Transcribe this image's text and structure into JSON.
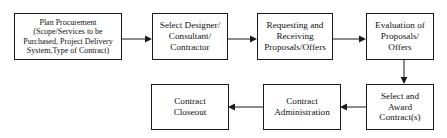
{
  "diagram": {
    "colors": {
      "stroke": "#1a1a1a",
      "text": "#111111",
      "background": "#ffffff"
    },
    "nodes": [
      {
        "id": "plan-procurement",
        "label": "Plan Procurement\n(Scope/Services to be\nPurchased, Project Delivery\nSystem,Type of Contract)"
      },
      {
        "id": "select-designer",
        "label": "Select Designer/\nConsultant/\nContractor"
      },
      {
        "id": "requesting-receiving",
        "label": "Requesting and\nReceiving\nProposals/Offers"
      },
      {
        "id": "evaluation-proposals",
        "label": "Evaluation of\nProposals/\nOffers"
      },
      {
        "id": "select-award",
        "label": "Select and\nAward\nContract(s)"
      },
      {
        "id": "contract-administration",
        "label": "Contract\nAdministration"
      },
      {
        "id": "contract-closeout",
        "label": "Contract\nCloseout"
      }
    ],
    "connectors": [
      {
        "id": "plan-to-select-designer",
        "direction": "right"
      },
      {
        "id": "select-designer-to-requesting",
        "direction": "right"
      },
      {
        "id": "requesting-to-evaluation",
        "direction": "right"
      },
      {
        "id": "evaluation-to-select-award",
        "direction": "down"
      },
      {
        "id": "select-award-to-administration",
        "direction": "left"
      },
      {
        "id": "administration-to-closeout",
        "direction": "left"
      }
    ]
  }
}
